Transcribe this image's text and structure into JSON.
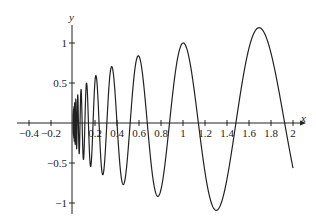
{
  "chart_data": {
    "type": "line",
    "title": "",
    "xlabel": "x",
    "ylabel": "y",
    "xlim": [
      -0.45,
      2.05
    ],
    "ylim": [
      -1.12,
      1.25
    ],
    "grid": false,
    "legend": null,
    "x_ticks": [
      -0.4,
      -0.2,
      0.2,
      0.4,
      0.6,
      0.8,
      1,
      1.2,
      1.4,
      1.6,
      1.8,
      2
    ],
    "x_tick_labels": [
      "−0.4",
      "−0.2",
      "0.2",
      "0.4",
      "0.6",
      "0.8",
      "1",
      "1.2",
      "1.4",
      "1.6",
      "1.8",
      "2"
    ],
    "y_ticks": [
      1,
      0.5,
      -0.5,
      -1
    ],
    "y_tick_labels": [
      "1",
      "0.5",
      "−0.5",
      "−1"
    ],
    "series": [
      {
        "name": "curve",
        "formula": "y = x^(1/3) * cos(12 ln x)",
        "x_range": [
          0.0005,
          2
        ],
        "approx_extrema": [
          {
            "x": 0.27,
            "y": -0.63
          },
          {
            "x": 0.35,
            "y": 0.75
          },
          {
            "x": 0.47,
            "y": -0.78
          },
          {
            "x": 0.58,
            "y": 0.88
          },
          {
            "x": 0.78,
            "y": -0.94
          },
          {
            "x": 0.99,
            "y": 1.04
          },
          {
            "x": 1.32,
            "y": -1.04
          },
          {
            "x": 1.68,
            "y": 1.21
          }
        ],
        "end_point": {
          "x": 2,
          "y": -0.49
        },
        "color": "#222222"
      }
    ]
  },
  "axes": {
    "x_label": "x",
    "y_label": "y",
    "color": "#222222"
  }
}
